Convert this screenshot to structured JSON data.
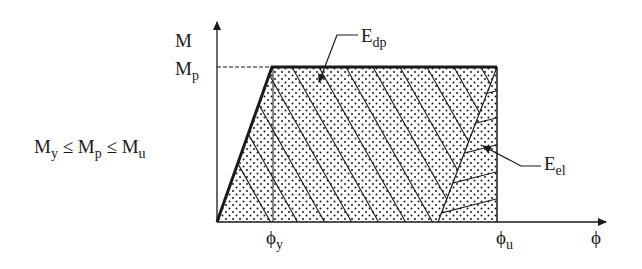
{
  "diagram": {
    "axes": {
      "y_label": "M",
      "x_label": "ϕ"
    },
    "y_ticks": [
      {
        "base": "M",
        "sub": "p"
      }
    ],
    "x_ticks": [
      {
        "base": "ϕ",
        "sub": "y"
      },
      {
        "base": "ϕ",
        "sub": "u"
      }
    ],
    "inequality": {
      "parts": [
        {
          "base": "M",
          "sub": "y"
        },
        {
          "op": " ≤ "
        },
        {
          "base": "M",
          "sub": "p"
        },
        {
          "op": " ≤ "
        },
        {
          "base": "M",
          "sub": "u"
        }
      ]
    },
    "regions": [
      {
        "name": "dissipated-plastic-energy",
        "label": {
          "base": "E",
          "sub": "dp"
        }
      },
      {
        "name": "elastic-energy",
        "label": {
          "base": "E",
          "sub": "el"
        }
      }
    ],
    "colors": {
      "ink": "#1a1a1a",
      "background": "#ffffff"
    }
  }
}
